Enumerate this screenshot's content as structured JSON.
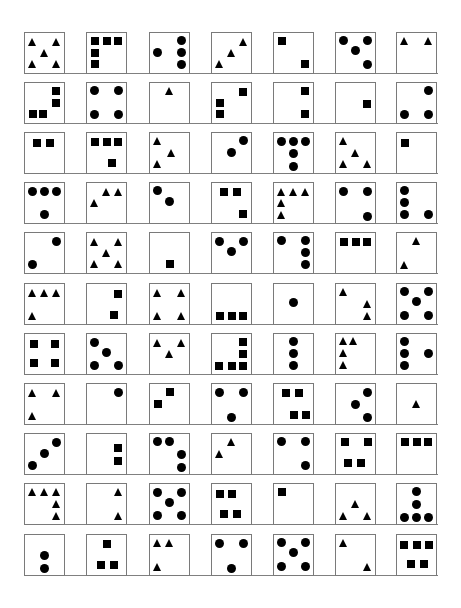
{
  "layout": {
    "col_x": [
      24,
      86,
      149,
      211,
      273,
      335,
      396
    ],
    "row_y": [
      32,
      82,
      132,
      182,
      232,
      283,
      333,
      383,
      433,
      483,
      534
    ],
    "box_size": 42,
    "border_color": "#7a7a7a",
    "glyph_color": "#000000"
  },
  "legend": {
    "sq": "square",
    "ci": "circle",
    "tr": "triangle"
  },
  "rows": [
    [
      {
        "shape": "tr",
        "pts": [
          [
            20,
            22
          ],
          [
            80,
            22
          ],
          [
            50,
            50
          ],
          [
            20,
            80
          ],
          [
            80,
            80
          ]
        ]
      },
      {
        "shape": "sq",
        "pts": [
          [
            20,
            20
          ],
          [
            50,
            20
          ],
          [
            80,
            20
          ],
          [
            20,
            50
          ],
          [
            20,
            80
          ]
        ]
      },
      {
        "shape": "ci",
        "pts": [
          [
            80,
            20
          ],
          [
            20,
            50
          ],
          [
            80,
            50
          ],
          [
            80,
            80
          ]
        ]
      },
      {
        "shape": "tr",
        "pts": [
          [
            80,
            22
          ],
          [
            50,
            50
          ],
          [
            20,
            80
          ]
        ]
      },
      {
        "shape": "sq",
        "pts": [
          [
            20,
            20
          ],
          [
            80,
            80
          ]
        ]
      },
      {
        "shape": "ci",
        "pts": [
          [
            20,
            20
          ],
          [
            80,
            20
          ],
          [
            50,
            45
          ],
          [
            80,
            80
          ]
        ]
      },
      {
        "shape": "tr",
        "pts": [
          [
            20,
            20
          ],
          [
            80,
            20
          ]
        ]
      }
    ],
    [
      {
        "shape": "sq",
        "pts": [
          [
            80,
            20
          ],
          [
            80,
            50
          ],
          [
            20,
            80
          ],
          [
            45,
            80
          ]
        ]
      },
      {
        "shape": "ci",
        "pts": [
          [
            20,
            20
          ],
          [
            80,
            20
          ],
          [
            20,
            80
          ],
          [
            80,
            80
          ]
        ]
      },
      {
        "shape": "tr",
        "pts": [
          [
            50,
            20
          ]
        ]
      },
      {
        "shape": "sq",
        "pts": [
          [
            80,
            22
          ],
          [
            20,
            50
          ],
          [
            20,
            80
          ]
        ]
      },
      {
        "shape": "sq",
        "pts": [
          [
            80,
            20
          ],
          [
            80,
            80
          ]
        ]
      },
      {
        "shape": "sq",
        "pts": [
          [
            80,
            55
          ]
        ]
      },
      {
        "shape": "ci",
        "pts": [
          [
            80,
            20
          ],
          [
            20,
            80
          ],
          [
            80,
            80
          ]
        ]
      }
    ],
    [
      {
        "shape": "sq",
        "pts": [
          [
            30,
            25
          ],
          [
            65,
            25
          ]
        ]
      },
      {
        "shape": "sq",
        "pts": [
          [
            20,
            22
          ],
          [
            50,
            22
          ],
          [
            80,
            22
          ],
          [
            65,
            78
          ]
        ]
      },
      {
        "shape": "tr",
        "pts": [
          [
            20,
            20
          ],
          [
            55,
            50
          ],
          [
            20,
            80
          ]
        ]
      },
      {
        "shape": "ci",
        "pts": [
          [
            80,
            20
          ],
          [
            50,
            50
          ]
        ]
      },
      {
        "shape": "ci",
        "pts": [
          [
            18,
            22
          ],
          [
            50,
            22
          ],
          [
            82,
            22
          ],
          [
            50,
            52
          ],
          [
            50,
            85
          ]
        ]
      },
      {
        "shape": "tr",
        "pts": [
          [
            20,
            20
          ],
          [
            50,
            50
          ],
          [
            20,
            80
          ],
          [
            80,
            80
          ]
        ]
      },
      {
        "shape": "sq",
        "pts": [
          [
            20,
            25
          ]
        ]
      }
    ],
    [
      {
        "shape": "ci",
        "pts": [
          [
            18,
            22
          ],
          [
            50,
            22
          ],
          [
            82,
            22
          ],
          [
            50,
            82
          ]
        ]
      },
      {
        "shape": "tr",
        "pts": [
          [
            50,
            22
          ],
          [
            80,
            22
          ],
          [
            20,
            50
          ]
        ]
      },
      {
        "shape": "ci",
        "pts": [
          [
            20,
            18
          ],
          [
            50,
            48
          ]
        ]
      },
      {
        "shape": "sq",
        "pts": [
          [
            30,
            22
          ],
          [
            65,
            22
          ],
          [
            80,
            80
          ]
        ]
      },
      {
        "shape": "tr",
        "pts": [
          [
            20,
            22
          ],
          [
            50,
            22
          ],
          [
            80,
            22
          ],
          [
            20,
            50
          ],
          [
            20,
            82
          ]
        ]
      },
      {
        "shape": "ci",
        "pts": [
          [
            20,
            22
          ],
          [
            80,
            22
          ],
          [
            80,
            85
          ]
        ]
      },
      {
        "shape": "ci",
        "pts": [
          [
            20,
            18
          ],
          [
            20,
            50
          ],
          [
            20,
            82
          ],
          [
            82,
            82
          ]
        ]
      }
    ],
    [
      {
        "shape": "ci",
        "pts": [
          [
            80,
            22
          ],
          [
            18,
            82
          ]
        ]
      },
      {
        "shape": "tr",
        "pts": [
          [
            20,
            22
          ],
          [
            80,
            22
          ],
          [
            50,
            50
          ],
          [
            20,
            80
          ],
          [
            80,
            80
          ]
        ]
      },
      {
        "shape": "sq",
        "pts": [
          [
            50,
            80
          ]
        ]
      },
      {
        "shape": "ci",
        "pts": [
          [
            20,
            22
          ],
          [
            80,
            22
          ],
          [
            50,
            48
          ]
        ]
      },
      {
        "shape": "ci",
        "pts": [
          [
            20,
            18
          ],
          [
            80,
            18
          ],
          [
            80,
            50
          ],
          [
            80,
            82
          ]
        ]
      },
      {
        "shape": "sq",
        "pts": [
          [
            20,
            22
          ],
          [
            50,
            22
          ],
          [
            80,
            22
          ]
        ]
      },
      {
        "shape": "tr",
        "pts": [
          [
            50,
            20
          ],
          [
            18,
            82
          ]
        ]
      }
    ],
    [
      {
        "shape": "tr",
        "pts": [
          [
            18,
            22
          ],
          [
            50,
            22
          ],
          [
            82,
            22
          ],
          [
            18,
            82
          ]
        ]
      },
      {
        "shape": "sq",
        "pts": [
          [
            80,
            25
          ],
          [
            70,
            80
          ]
        ]
      },
      {
        "shape": "tr",
        "pts": [
          [
            20,
            22
          ],
          [
            80,
            22
          ],
          [
            20,
            82
          ],
          [
            80,
            82
          ]
        ]
      },
      {
        "shape": "sq",
        "pts": [
          [
            20,
            82
          ],
          [
            50,
            82
          ],
          [
            80,
            82
          ]
        ]
      },
      {
        "shape": "ci",
        "pts": [
          [
            50,
            48
          ]
        ]
      },
      {
        "shape": "tr",
        "pts": [
          [
            20,
            20
          ],
          [
            80,
            52
          ],
          [
            80,
            82
          ]
        ]
      },
      {
        "shape": "ci",
        "pts": [
          [
            20,
            18
          ],
          [
            80,
            18
          ],
          [
            50,
            45
          ],
          [
            20,
            80
          ],
          [
            80,
            80
          ]
        ]
      }
    ],
    [
      {
        "shape": "sq",
        "pts": [
          [
            22,
            25
          ],
          [
            78,
            25
          ],
          [
            22,
            75
          ],
          [
            78,
            75
          ]
        ]
      },
      {
        "shape": "ci",
        "pts": [
          [
            18,
            22
          ],
          [
            50,
            48
          ],
          [
            18,
            82
          ],
          [
            82,
            82
          ]
        ]
      },
      {
        "shape": "tr",
        "pts": [
          [
            20,
            22
          ],
          [
            80,
            22
          ],
          [
            50,
            50
          ]
        ]
      },
      {
        "shape": "sq",
        "pts": [
          [
            80,
            20
          ],
          [
            80,
            50
          ],
          [
            18,
            82
          ],
          [
            50,
            82
          ],
          [
            80,
            82
          ]
        ]
      },
      {
        "shape": "ci",
        "pts": [
          [
            50,
            20
          ],
          [
            50,
            50
          ],
          [
            50,
            82
          ]
        ]
      },
      {
        "shape": "tr",
        "pts": [
          [
            18,
            18
          ],
          [
            45,
            18
          ],
          [
            18,
            48
          ],
          [
            18,
            80
          ]
        ]
      },
      {
        "shape": "ci",
        "pts": [
          [
            18,
            18
          ],
          [
            18,
            50
          ],
          [
            82,
            50
          ],
          [
            18,
            82
          ]
        ]
      }
    ],
    [
      {
        "shape": "tr",
        "pts": [
          [
            20,
            22
          ],
          [
            80,
            22
          ],
          [
            20,
            82
          ]
        ]
      },
      {
        "shape": "ci",
        "pts": [
          [
            80,
            22
          ]
        ]
      },
      {
        "shape": "sq",
        "pts": [
          [
            50,
            20
          ],
          [
            20,
            50
          ]
        ]
      },
      {
        "shape": "ci",
        "pts": [
          [
            18,
            22
          ],
          [
            82,
            22
          ],
          [
            50,
            85
          ]
        ]
      },
      {
        "shape": "sq",
        "pts": [
          [
            30,
            22
          ],
          [
            65,
            22
          ],
          [
            50,
            80
          ],
          [
            82,
            80
          ]
        ]
      },
      {
        "shape": "ci",
        "pts": [
          [
            82,
            22
          ],
          [
            50,
            52
          ],
          [
            82,
            85
          ]
        ]
      },
      {
        "shape": "tr",
        "pts": [
          [
            50,
            50
          ]
        ]
      }
    ],
    [
      {
        "shape": "ci",
        "pts": [
          [
            82,
            22
          ],
          [
            50,
            50
          ],
          [
            18,
            82
          ]
        ]
      },
      {
        "shape": "sq",
        "pts": [
          [
            80,
            35
          ],
          [
            80,
            70
          ]
        ]
      },
      {
        "shape": "ci",
        "pts": [
          [
            18,
            20
          ],
          [
            50,
            20
          ],
          [
            82,
            52
          ],
          [
            82,
            85
          ]
        ]
      },
      {
        "shape": "tr",
        "pts": [
          [
            50,
            20
          ],
          [
            18,
            52
          ]
        ]
      },
      {
        "shape": "ci",
        "pts": [
          [
            18,
            20
          ],
          [
            82,
            20
          ],
          [
            82,
            82
          ]
        ]
      },
      {
        "shape": "sq",
        "pts": [
          [
            22,
            20
          ],
          [
            82,
            20
          ],
          [
            30,
            75
          ],
          [
            65,
            75
          ]
        ]
      },
      {
        "shape": "sq",
        "pts": [
          [
            20,
            20
          ],
          [
            50,
            20
          ],
          [
            80,
            20
          ]
        ]
      }
    ],
    [
      {
        "shape": "tr",
        "pts": [
          [
            18,
            20
          ],
          [
            50,
            20
          ],
          [
            82,
            20
          ],
          [
            82,
            52
          ],
          [
            82,
            82
          ]
        ]
      },
      {
        "shape": "tr",
        "pts": [
          [
            80,
            20
          ],
          [
            80,
            82
          ]
        ]
      },
      {
        "shape": "ci",
        "pts": [
          [
            18,
            22
          ],
          [
            82,
            22
          ],
          [
            50,
            48
          ],
          [
            18,
            82
          ],
          [
            82,
            82
          ]
        ]
      },
      {
        "shape": "sq",
        "pts": [
          [
            20,
            25
          ],
          [
            50,
            25
          ],
          [
            30,
            78
          ],
          [
            65,
            78
          ]
        ]
      },
      {
        "shape": "sq",
        "pts": [
          [
            20,
            20
          ]
        ]
      },
      {
        "shape": "tr",
        "pts": [
          [
            50,
            52
          ],
          [
            18,
            82
          ],
          [
            82,
            82
          ]
        ]
      },
      {
        "shape": "ci",
        "pts": [
          [
            50,
            20
          ],
          [
            50,
            52
          ],
          [
            18,
            85
          ],
          [
            50,
            85
          ],
          [
            82,
            85
          ]
        ]
      }
    ],
    [
      {
        "shape": "ci",
        "pts": [
          [
            50,
            52
          ],
          [
            50,
            85
          ]
        ]
      },
      {
        "shape": "sq",
        "pts": [
          [
            50,
            22
          ],
          [
            35,
            78
          ],
          [
            68,
            78
          ]
        ]
      },
      {
        "shape": "tr",
        "pts": [
          [
            20,
            20
          ],
          [
            50,
            20
          ],
          [
            20,
            82
          ]
        ]
      },
      {
        "shape": "ci",
        "pts": [
          [
            18,
            22
          ],
          [
            82,
            22
          ],
          [
            50,
            85
          ]
        ]
      },
      {
        "shape": "ci",
        "pts": [
          [
            18,
            20
          ],
          [
            82,
            20
          ],
          [
            50,
            45
          ],
          [
            18,
            80
          ],
          [
            82,
            80
          ]
        ]
      },
      {
        "shape": "tr",
        "pts": [
          [
            18,
            20
          ],
          [
            82,
            82
          ]
        ]
      },
      {
        "shape": "sq",
        "pts": [
          [
            18,
            25
          ],
          [
            50,
            25
          ],
          [
            82,
            25
          ],
          [
            35,
            75
          ],
          [
            68,
            75
          ]
        ]
      }
    ]
  ]
}
